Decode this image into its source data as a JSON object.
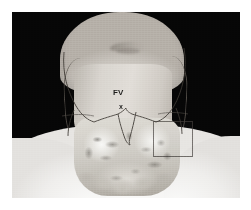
{
  "image": {
    "kind": "thyroid-scintigraphy-overlay",
    "frame": {
      "background_color": "#060606",
      "left": 12,
      "top": 12,
      "width": 228,
      "height": 186
    },
    "margin_color": "#ffffff"
  },
  "subject": {
    "view": "anterior",
    "regions": [
      {
        "name": "face",
        "label": ""
      },
      {
        "name": "neck",
        "label": ""
      },
      {
        "name": "shoulders",
        "label": ""
      }
    ]
  },
  "overlay": {
    "name": "thyroid-uptake",
    "tone_light": "#efeeea",
    "tone_mid": "#c5c1b8",
    "tone_dark": "#7d786f"
  },
  "annotations": {
    "label_fv": "FV",
    "marker_x": "x",
    "roi_box": {
      "name": "region-of-interest",
      "stroke_color": "#3c3834"
    }
  }
}
